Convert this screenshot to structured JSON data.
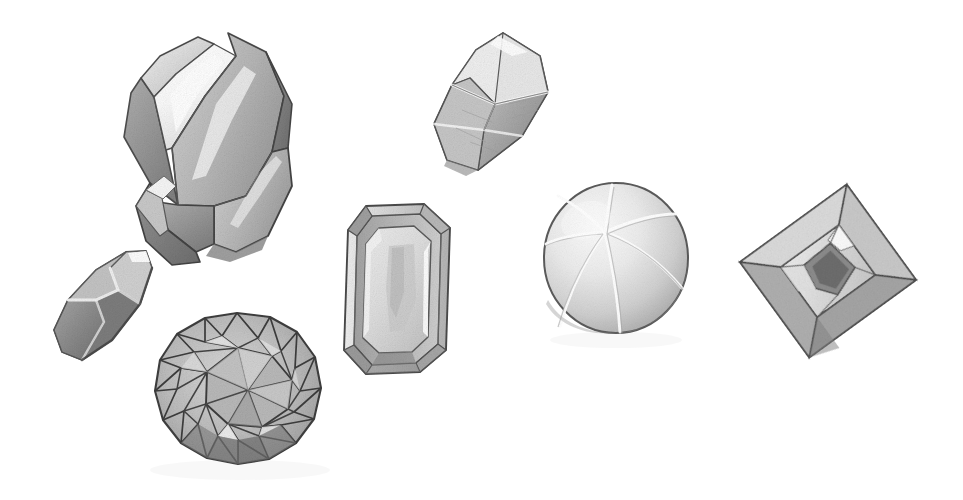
{
  "illustration": {
    "title": "Assorted Gemstone and Crystal Cuts",
    "medium": "grayscale pencil and wash illustration",
    "background_color": "#ffffff",
    "width": 963,
    "height": 500,
    "palette": {
      "outline": "#4a4a4a",
      "outline_dark": "#3a3a3a",
      "shadow": "#8d8d8d",
      "midtone": "#b4b4b4",
      "light": "#d8d8d8",
      "highlight": "#f2f2f2",
      "white": "#ffffff",
      "deep": "#6e6e6e"
    },
    "object_count": 7
  },
  "objects": [
    {
      "id": "quartz-crystal",
      "label": "Terminated prismatic quartz crystal with secondary crystal",
      "shape": "hexagonal prism with pyramidal termination",
      "bbox": [
        95,
        28,
        215,
        260
      ],
      "rotation_deg": 34,
      "tone": "light gray with bright specular stripe"
    },
    {
      "id": "octahedron-crystal",
      "label": "Octahedral bipyramid crystal with X ridge",
      "shape": "elongated octahedron",
      "bbox": [
        428,
        28,
        130,
        150
      ],
      "rotation_deg": -52,
      "tone": "pale gray, stippled texture"
    },
    {
      "id": "marquise-gem",
      "label": "Small marquise navette cut gem",
      "shape": "lens / navette with crossing ridges",
      "bbox": [
        48,
        248,
        104,
        116
      ],
      "rotation_deg": -44,
      "tone": "mid gray with white ridge lines"
    },
    {
      "id": "emerald-cut-gem",
      "label": "Emerald cut gem, step-cut with clipped corners",
      "shape": "octagonal step cut",
      "bbox": [
        342,
        202,
        110,
        172
      ],
      "rotation_deg": 4,
      "tone": "light gray table with darker bevels"
    },
    {
      "id": "round-brilliant-gem",
      "label": "Round brilliant cut gem with triangular facets",
      "shape": "round brilliant, 16-sided girdle",
      "bbox": [
        152,
        312,
        170,
        166
      ],
      "rotation_deg": 0,
      "tone": "mid gray with dark facet edges"
    },
    {
      "id": "cabochon-sphere",
      "label": "Polished sphere cabochon with radiating seam lines",
      "shape": "sphere / high cabochon",
      "bbox": [
        543,
        182,
        146,
        152
      ],
      "rotation_deg": 0,
      "tone": "soft gray gradient, light from upper left"
    },
    {
      "id": "baguette-gem",
      "label": "Rectangular baguette cut gem, tilted",
      "shape": "rectangular step cut with kite facets",
      "bbox": [
        752,
        192,
        152,
        158
      ],
      "rotation_deg": -36,
      "tone": "translucent gray with dark inclusion core"
    }
  ],
  "caption": "Assorted Gemstone and Crystal Cuts"
}
